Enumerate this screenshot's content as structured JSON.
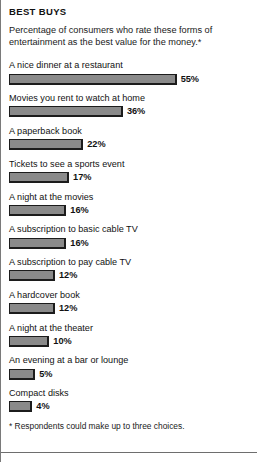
{
  "headline": "BEST BUYS",
  "deck": "Percentage of consumers who rate these forms of entertainment as the best value for the money.*",
  "footnote": "* Respondents could make up to three choices.",
  "colors": {
    "bar_fill": "#8a8a8a",
    "bar_border": "#1c1c1c",
    "text": "#111111",
    "frame_rule": "#6e6e6e",
    "background": "#ffffff"
  },
  "chart_data": {
    "type": "bar",
    "orientation": "horizontal",
    "title": "BEST BUYS",
    "subtitle": "Percentage of consumers who rate these forms of entertainment as the best value for the money.*",
    "xlabel": "",
    "ylabel": "",
    "xlim": [
      0,
      55
    ],
    "grid": false,
    "legend": "none",
    "value_suffix": "%",
    "annotation": "* Respondents could make up to three choices.",
    "categories": [
      "A nice dinner at a restaurant",
      "Movies you rent to watch at home",
      "A paperback book",
      "Tickets to see a sports event",
      "A night at the movies",
      "A subscription to basic cable TV",
      "A subscription to pay cable TV",
      "A hardcover book",
      "A night at the theater",
      "An evening at a bar or lounge",
      "Compact disks"
    ],
    "values": [
      55,
      36,
      22,
      17,
      16,
      16,
      12,
      12,
      10,
      5,
      4
    ],
    "value_labels": [
      "55%",
      "36%",
      "22%",
      "17%",
      "16%",
      "16%",
      "12%",
      "12%",
      "10%",
      "5%",
      "4%"
    ]
  }
}
